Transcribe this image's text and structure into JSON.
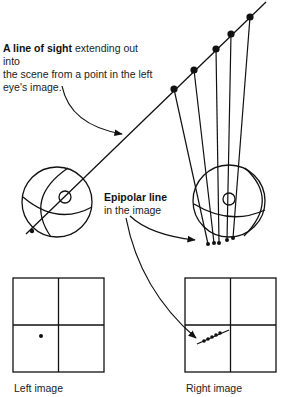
{
  "annotations": {
    "line_of_sight": {
      "bold": "A line of sight",
      "rest_line1": " extending out into",
      "line2": "the scene from a point in the left",
      "line3": "eye's image."
    },
    "epipolar_line": {
      "bold": "Epipolar line",
      "rest": "in the image"
    }
  },
  "captions": {
    "left_image": "Left image",
    "right_image": "Right image"
  },
  "colors": {
    "stroke": "#111111",
    "background": "#ffffff"
  },
  "geometry": {
    "line_of_sight": {
      "x1": 26,
      "y1": 234,
      "x2": 266,
      "y2": 2
    },
    "scene_points": [
      {
        "x": 174,
        "y": 89
      },
      {
        "x": 194,
        "y": 70
      },
      {
        "x": 216,
        "y": 49
      },
      {
        "x": 231,
        "y": 34
      },
      {
        "x": 250,
        "y": 17
      }
    ],
    "right_retina_points": [
      {
        "x": 208,
        "y": 244
      },
      {
        "x": 214,
        "y": 243
      },
      {
        "x": 219,
        "y": 243
      },
      {
        "x": 227,
        "y": 240
      },
      {
        "x": 233,
        "y": 238
      }
    ],
    "left_eye": {
      "cx": 57,
      "cy": 202,
      "r": 35,
      "pupil_cx": 65,
      "pupil_cy": 197,
      "pupil_r": 6,
      "retina_dot_x": 32,
      "retina_dot_y": 231
    },
    "right_eye": {
      "cx": 229,
      "cy": 201,
      "r": 36,
      "pupil_cx": 229,
      "pupil_cy": 199,
      "pupil_r": 6
    },
    "left_grid": {
      "x": 13,
      "y": 278,
      "w": 91,
      "h": 94,
      "dot_x": 41,
      "dot_y": 336
    },
    "right_grid": {
      "x": 185,
      "y": 278,
      "w": 91,
      "h": 94,
      "epi_dots": [
        {
          "x": 204,
          "y": 341
        },
        {
          "x": 208,
          "y": 339
        },
        {
          "x": 212,
          "y": 337
        },
        {
          "x": 216,
          "y": 335
        },
        {
          "x": 220,
          "y": 333
        }
      ],
      "epi_line": {
        "x1": 197,
        "y1": 344,
        "x2": 229,
        "y2": 330
      }
    }
  }
}
